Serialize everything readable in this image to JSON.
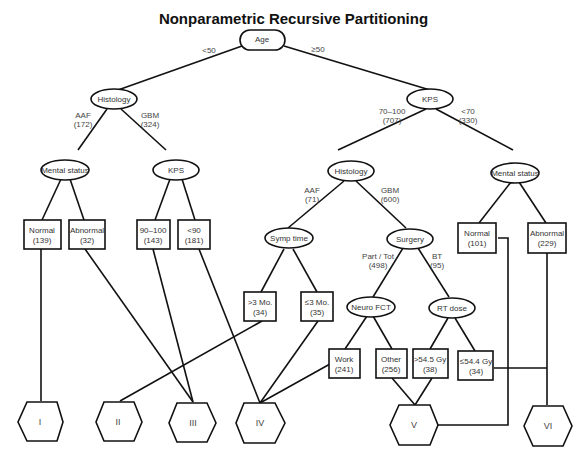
{
  "title": "Nonparametric Recursive Partitioning",
  "nodes": {
    "age": {
      "label": "Age",
      "shape": "rounded"
    },
    "histology_left": {
      "label": "Histology",
      "shape": "ellipse"
    },
    "kps_right": {
      "label": "KPS",
      "shape": "ellipse"
    },
    "mental_status_left": {
      "label": "Mental status",
      "shape": "ellipse"
    },
    "kps_left": {
      "label": "KPS",
      "shape": "ellipse"
    },
    "histology_right": {
      "label": "Histology",
      "shape": "ellipse"
    },
    "mental_status_right": {
      "label": "Mental status",
      "shape": "ellipse"
    },
    "symp_time": {
      "label": "Symp time",
      "shape": "ellipse"
    },
    "surgery": {
      "label": "Surgery",
      "shape": "ellipse"
    },
    "neuro_fct": {
      "label": "Neuro FCT",
      "shape": "ellipse"
    },
    "rt_dose": {
      "label": "RT dose",
      "shape": "ellipse"
    }
  },
  "leaves": {
    "normal_139": {
      "line1": "Normal",
      "line2": "(139)"
    },
    "abnormal_32": {
      "line1": "Abnormal",
      "line2": "(32)"
    },
    "kps_90_100": {
      "line1": "90–100",
      "line2": "(143)"
    },
    "kps_lt90": {
      "line1": "<90",
      "line2": "(181)"
    },
    "gt3mo": {
      "line1": ">3 Mo.",
      "line2": "(34)"
    },
    "le3mo": {
      "line1": "≤3 Mo.",
      "line2": "(35)"
    },
    "work": {
      "line1": "Work",
      "line2": "(241)"
    },
    "other": {
      "line1": "Other",
      "line2": "(256)"
    },
    "gt545": {
      "line1": ">54.5 Gy",
      "line2": "(38)"
    },
    "le544": {
      "line1": "≤54.4 Gy",
      "line2": "(34)"
    },
    "normal_101": {
      "line1": "Normal",
      "line2": "(101)"
    },
    "abnormal_229": {
      "line1": "Abnormal",
      "line2": "(229)"
    }
  },
  "edge_labels": {
    "age_lt50": {
      "line1": "<50",
      "line2": ""
    },
    "age_ge50": {
      "line1": "≥50",
      "line2": ""
    },
    "hist_aaf_172": {
      "line1": "AAF",
      "line2": "(172)"
    },
    "hist_gbm_324": {
      "line1": "GBM",
      "line2": "(324)"
    },
    "kps_70_100": {
      "line1": "70–100",
      "line2": "(707)"
    },
    "kps_lt70": {
      "line1": "<70",
      "line2": "(330)"
    },
    "hist_aaf_71": {
      "line1": "AAF",
      "line2": "(71)"
    },
    "hist_gbm_600": {
      "line1": "GBM",
      "line2": "(600)"
    },
    "surg_part_tot": {
      "line1": "Part / Tot",
      "line2": "(498)"
    },
    "surg_bt": {
      "line1": "BT",
      "line2": "(95)"
    }
  },
  "classes": [
    "I",
    "II",
    "III",
    "IV",
    "V",
    "VI"
  ]
}
